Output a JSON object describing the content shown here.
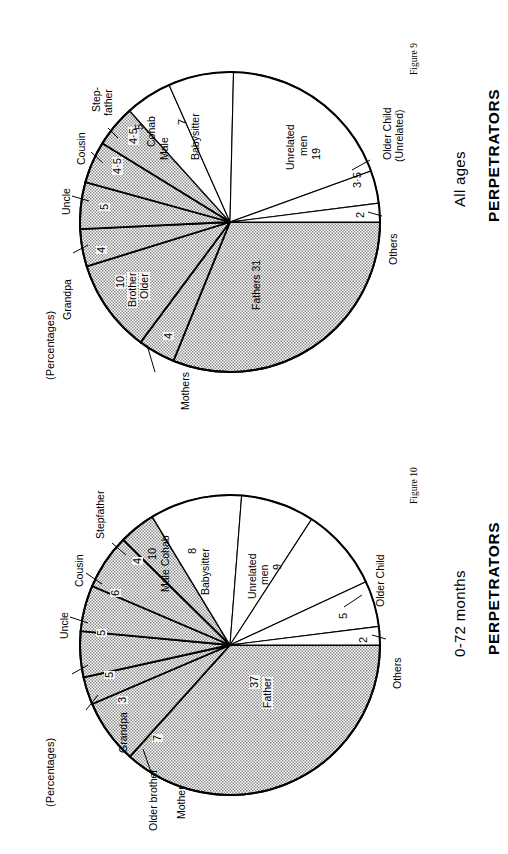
{
  "page": {
    "percentages_note": "(Percentages)"
  },
  "figures": [
    {
      "id": "figure-9",
      "caption": "Figure 9",
      "title": "PERPETRATORS",
      "subtitle": "All ages",
      "note": "(Percentages)",
      "chart_data": {
        "type": "pie",
        "title": "PERPETRATORS — All ages",
        "unit": "percent",
        "legend": "none",
        "labels": [
          "Fathers",
          "Mothers",
          "Older Brother",
          "Grandpa",
          "Uncle",
          "Cousin",
          "Step-father",
          "Male Cohab",
          "Babysitter",
          "Unrelated men",
          "Older Child (Unrelated)",
          "Others"
        ],
        "values": [
          31,
          4,
          10,
          4,
          5,
          4.5,
          4.5,
          5,
          7,
          19,
          3.5,
          2
        ],
        "value_labels": [
          "31",
          "4",
          "10",
          "4",
          "5",
          "4·5",
          "4·5",
          "5",
          "7",
          "19",
          "3·5",
          "2"
        ],
        "shaded": [
          true,
          true,
          true,
          true,
          true,
          true,
          true,
          false,
          false,
          false,
          false,
          false
        ],
        "slices": [
          {
            "name": "Fathers",
            "label": "Fathers  31",
            "value": 31,
            "value_text": "31",
            "shaded": true
          },
          {
            "name": "Mothers",
            "label": "Mothers",
            "value": 4,
            "value_text": "4",
            "shaded": true
          },
          {
            "name": "Older Brother",
            "label": "Older\nBrother\n10",
            "value": 10,
            "value_text": "10",
            "shaded": true
          },
          {
            "name": "Grandpa",
            "label": "Grandpa",
            "value": 4,
            "value_text": "4",
            "shaded": true
          },
          {
            "name": "Uncle",
            "label": "Uncle",
            "value": 5,
            "value_text": "5",
            "shaded": true
          },
          {
            "name": "Cousin",
            "label": "Cousin",
            "value": 4.5,
            "value_text": "4·5",
            "shaded": true
          },
          {
            "name": "Step-father",
            "label": "Step-\nfather",
            "value": 4.5,
            "value_text": "4·5",
            "shaded": true
          },
          {
            "name": "Male Cohab",
            "label": "Male\nCohab\n5",
            "value": 5,
            "value_text": "5",
            "shaded": false
          },
          {
            "name": "Babysitter",
            "label": "Babysitter\n7",
            "value": 7,
            "value_text": "7",
            "shaded": false
          },
          {
            "name": "Unrelated men",
            "label": "Unrelated\nmen  19",
            "value": 19,
            "value_text": "19",
            "shaded": false
          },
          {
            "name": "Older Child (Unrelated)",
            "label": "Older Child\n(Unrelated)",
            "value": 3.5,
            "value_text": "3·5",
            "shaded": false
          },
          {
            "name": "Others",
            "label": "Others",
            "value": 2,
            "value_text": "2",
            "shaded": false
          }
        ]
      },
      "text": {
        "fathers": "Fathers  31",
        "mothers": "Mothers",
        "mothers_val": "4",
        "older_brother_l1": "Older",
        "older_brother_l2": "Brother",
        "older_brother_val": "10",
        "grandpa": "Grandpa",
        "grandpa_val": "4",
        "uncle": "Uncle",
        "uncle_val": "5",
        "cousin": "Cousin",
        "cousin_val": "4·5",
        "stepfather_l1": "Step-",
        "stepfather_l2": "father",
        "stepfather_val": "4·5",
        "male_cohab_l1": "Male",
        "male_cohab_l2": "Cohab",
        "male_cohab_val": "5",
        "babysitter": "Babysitter",
        "babysitter_val": "7",
        "unrelated_l1": "Unrelated",
        "unrelated_l2": "men",
        "unrelated_val": "19",
        "older_child_l1": "Older Child",
        "older_child_l2": "(Unrelated)",
        "older_child_val": "3·5",
        "others": "Others",
        "others_val": "2"
      }
    },
    {
      "id": "figure-10",
      "caption": "Figure 10",
      "title": "PERPETRATORS",
      "subtitle": "0-72 months",
      "note": "(Percentages)",
      "chart_data": {
        "type": "pie",
        "title": "PERPETRATORS — 0-72 months",
        "unit": "percent",
        "legend": "none",
        "labels": [
          "Father",
          "Mother",
          "Older brother",
          "Grandpa",
          "Uncle",
          "Cousin",
          "Stepfather",
          "Male Cohab",
          "Babysitter",
          "Unrelated men",
          "Older Child",
          "Others"
        ],
        "values": [
          37,
          7,
          3,
          5,
          5,
          6,
          4,
          10,
          8,
          9,
          5,
          2
        ],
        "value_labels": [
          "37",
          "7",
          "3",
          "5",
          "5",
          "6",
          "4",
          "10",
          "8",
          "9",
          "5",
          "2"
        ],
        "shaded": [
          true,
          true,
          true,
          true,
          true,
          true,
          true,
          false,
          false,
          false,
          false,
          false
        ],
        "slices": [
          {
            "name": "Father",
            "label": "Father\n37",
            "value": 37,
            "value_text": "37",
            "shaded": true
          },
          {
            "name": "Mother",
            "label": "Mother",
            "value": 7,
            "value_text": "7",
            "shaded": true
          },
          {
            "name": "Older brother",
            "label": "Older brother",
            "value": 3,
            "value_text": "3",
            "shaded": true
          },
          {
            "name": "Grandpa",
            "label": "Grandpa",
            "value": 5,
            "value_text": "5",
            "shaded": true
          },
          {
            "name": "Uncle",
            "label": "Uncle",
            "value": 5,
            "value_text": "5",
            "shaded": true
          },
          {
            "name": "Cousin",
            "label": "Cousin",
            "value": 6,
            "value_text": "6",
            "shaded": true
          },
          {
            "name": "Stepfather",
            "label": "Stepfather",
            "value": 4,
            "value_text": "4",
            "shaded": true
          },
          {
            "name": "Male Cohab",
            "label": "Male Cohab\n10",
            "value": 10,
            "value_text": "10",
            "shaded": false
          },
          {
            "name": "Babysitter",
            "label": "Babysitter\n8",
            "value": 8,
            "value_text": "8",
            "shaded": false
          },
          {
            "name": "Unrelated men",
            "label": "Unrelated\nmen  9",
            "value": 9,
            "value_text": "9",
            "shaded": false
          },
          {
            "name": "Older Child",
            "label": "Older Child",
            "value": 5,
            "value_text": "5",
            "shaded": false
          },
          {
            "name": "Others",
            "label": "Others",
            "value": 2,
            "value_text": "2",
            "shaded": false
          }
        ]
      },
      "text": {
        "father_l1": "Father",
        "father_val": "37",
        "mother": "Mother",
        "mother_val": "7",
        "older_brother": "Older brother",
        "older_brother_val": "3",
        "grandpa": "Grandpa",
        "grandpa_val": "5",
        "uncle": "Uncle",
        "uncle_val": "5",
        "cousin": "Cousin",
        "cousin_val": "6",
        "stepfather": "Stepfather",
        "stepfather_val": "4",
        "male_cohab_l1": "Male Cohab",
        "male_cohab_val": "10",
        "babysitter": "Babysitter",
        "babysitter_val": "8",
        "unrelated_l1": "Unrelated",
        "unrelated_l2": "men",
        "unrelated_val": "9",
        "older_child": "Older Child",
        "older_child_val": "5",
        "others": "Others",
        "others_val": "2"
      }
    }
  ]
}
